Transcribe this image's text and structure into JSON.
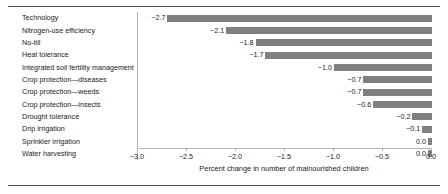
{
  "chart_data": {
    "type": "bar",
    "orientation": "horizontal",
    "title": "",
    "xlabel": "Percent change in number of malnourished children",
    "ylabel": "",
    "xlim": [
      -3.0,
      0.0
    ],
    "xticks": [
      -3.0,
      -2.5,
      -2.0,
      -1.5,
      -1.0,
      -0.5,
      0.0
    ],
    "xticklabels": [
      "−3.0",
      "−2.5",
      "−2.0",
      "−1.5",
      "−1.0",
      "−0.5",
      "0.0"
    ],
    "grid": false,
    "legend": null,
    "bar_color": "#808080",
    "categories": [
      "Technology",
      "Nitrogen-use efficiency",
      "No-till",
      "Heat tolerance",
      "Integrated soil fertility management",
      "Crop protection—diseases",
      "Crop protection—weeds",
      "Crop protection—insects",
      "Drought tolerance",
      "Drip irrigation",
      "Sprinkler irrigation",
      "Water harvesting"
    ],
    "values": [
      -2.7,
      -2.1,
      -1.8,
      -1.7,
      -1.0,
      -0.7,
      -0.7,
      -0.6,
      -0.2,
      -0.1,
      -0.04,
      -0.04
    ],
    "data_labels": [
      "−2.7",
      "−2.1",
      "−1.8",
      "−1.7",
      "−1.0",
      "−0.7",
      "−0.7",
      "−0.6",
      "−0.2",
      "−0.1",
      "0.0",
      "0.0"
    ]
  },
  "figure": {
    "top_rule_color": "#4d4d4d",
    "bottom_rule_color": "#4d4d4d",
    "axis_color": "#b5b5b5",
    "background": "#ffffff"
  }
}
